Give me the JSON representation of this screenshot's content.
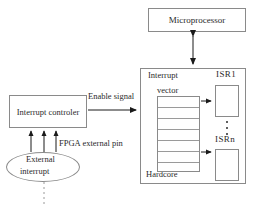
{
  "diagram": {
    "blocks": {
      "microprocessor": {
        "label": "Microprocessor"
      },
      "interrupt_controller": {
        "label": "Interrupt controler"
      },
      "hardcore": {
        "label": "Hardcore"
      },
      "interrupt_vector": {
        "label_line1": "Interrupt",
        "label_line2": "vector",
        "row_count": 7
      },
      "isr1": {
        "label": "ISR1"
      },
      "isrn": {
        "label": "ISRn"
      },
      "external_interrupt": {
        "label_line1": "External",
        "label_line2": "interrupt"
      }
    },
    "edge_labels": {
      "enable_signal": "Enable signal",
      "fpga_external_pin": "FPGA external pin"
    },
    "ellipsis": "vertical-ellipsis",
    "colors": {
      "stroke": "#8a8a8a",
      "text": "#2b2b2b",
      "arrow": "#1a1a1a",
      "background": "#ffffff"
    }
  }
}
